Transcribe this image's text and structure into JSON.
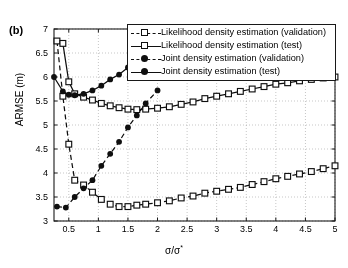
{
  "panel": {
    "label": "(b)"
  },
  "axes": {
    "ylabel": "ARMSE (m)",
    "xlabel_base": "σ/σ",
    "xlabel_sup": "*",
    "xticks": [
      "0.5",
      "1",
      "1.5",
      "2",
      "2.5",
      "3",
      "3.5",
      "4",
      "4.5",
      "5"
    ],
    "yticks": [
      "3",
      "3.5",
      "4",
      "4.5",
      "5",
      "5.5",
      "6",
      "6.5",
      "7"
    ]
  },
  "legend": {
    "items": [
      {
        "label": "Likelihood density estimation (validation)",
        "style": "dashdot",
        "marker": "square"
      },
      {
        "label": "Likelihood density estimation (test)",
        "style": "solid",
        "marker": "square"
      },
      {
        "label": "Joint density estimation (validation)",
        "style": "dashdot",
        "marker": "dot"
      },
      {
        "label": "Joint density estimation (test)",
        "style": "solid",
        "marker": "dot"
      }
    ]
  },
  "chart_data": {
    "type": "line",
    "title": "",
    "xlabel": "σ/σ*",
    "ylabel": "ARMSE (m)",
    "xlim": [
      0.25,
      5.0
    ],
    "ylim": [
      3.0,
      7.0
    ],
    "grid": true,
    "legend_position": "top-right (inside, overlapping data)",
    "series": [
      {
        "name": "Likelihood density estimation (validation)",
        "linestyle": "dashed",
        "marker": "open-square",
        "x": [
          0.3,
          0.4,
          0.5,
          0.6,
          0.75,
          0.9,
          1.05,
          1.2,
          1.35,
          1.5,
          1.65,
          1.8,
          2.0,
          2.2,
          2.4,
          2.6,
          2.8,
          3.0,
          3.2,
          3.4,
          3.6,
          3.8,
          4.0,
          4.2,
          4.4,
          4.6,
          4.8,
          5.0
        ],
        "y": [
          6.75,
          5.6,
          4.6,
          3.85,
          3.75,
          3.6,
          3.45,
          3.35,
          3.3,
          3.3,
          3.33,
          3.35,
          3.38,
          3.42,
          3.48,
          3.52,
          3.58,
          3.62,
          3.66,
          3.7,
          3.76,
          3.82,
          3.88,
          3.93,
          3.98,
          4.03,
          4.09,
          4.15
        ]
      },
      {
        "name": "Likelihood density estimation (test)",
        "linestyle": "solid",
        "marker": "open-square",
        "x": [
          0.4,
          0.5,
          0.6,
          0.75,
          0.9,
          1.05,
          1.2,
          1.35,
          1.5,
          1.65,
          1.8,
          2.0,
          2.2,
          2.4,
          2.6,
          2.8,
          3.0,
          3.2,
          3.4,
          3.6,
          3.8,
          4.0,
          4.2,
          4.4,
          4.6,
          4.8,
          5.0
        ],
        "y": [
          6.7,
          5.9,
          5.65,
          5.58,
          5.52,
          5.45,
          5.4,
          5.36,
          5.33,
          5.32,
          5.33,
          5.35,
          5.38,
          5.43,
          5.48,
          5.55,
          5.6,
          5.65,
          5.7,
          5.75,
          5.8,
          5.85,
          5.88,
          5.92,
          5.95,
          5.98,
          6.0
        ]
      },
      {
        "name": "Joint density estimation (validation)",
        "linestyle": "dashed",
        "marker": "filled-circle",
        "x": [
          0.3,
          0.45,
          0.6,
          0.75,
          0.9,
          1.05,
          1.2,
          1.35,
          1.5,
          1.65,
          1.8,
          2.0
        ],
        "y": [
          3.3,
          3.28,
          3.5,
          3.68,
          3.85,
          4.15,
          4.4,
          4.65,
          4.95,
          5.2,
          5.45,
          5.72
        ]
      },
      {
        "name": "Joint density estimation (test)",
        "linestyle": "solid",
        "marker": "filled-circle",
        "x": [
          0.25,
          0.4,
          0.5,
          0.6,
          0.75,
          0.9,
          1.05,
          1.2,
          1.35,
          1.5
        ],
        "y": [
          6.0,
          5.7,
          5.63,
          5.62,
          5.65,
          5.72,
          5.82,
          5.95,
          6.05,
          6.2
        ]
      }
    ]
  }
}
